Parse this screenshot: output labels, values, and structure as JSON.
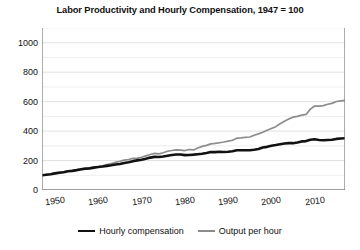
{
  "chart_data": {
    "type": "line",
    "title": "Labor Productivity and Hourly Compensation, 1947 = 100",
    "xlabel": "",
    "ylabel": "",
    "xlim": [
      1947,
      2017
    ],
    "ylim": [
      0,
      1100
    ],
    "grid": true,
    "grid_minor_step": 100,
    "legend_position": "bottom-center",
    "ytick_labels": [
      "0",
      "200",
      "400",
      "600",
      "800",
      "1000"
    ],
    "ytick_values": [
      0,
      200,
      400,
      600,
      800,
      1000
    ],
    "xtick_labels": [
      "1950",
      "1960",
      "1970",
      "1980",
      "1990",
      "2000",
      "2010"
    ],
    "xtick_values": [
      1950,
      1960,
      1970,
      1980,
      1990,
      2000,
      2010
    ],
    "x": [
      1947,
      1948,
      1949,
      1950,
      1951,
      1952,
      1953,
      1954,
      1955,
      1956,
      1957,
      1958,
      1959,
      1960,
      1961,
      1962,
      1963,
      1964,
      1965,
      1966,
      1967,
      1968,
      1969,
      1970,
      1971,
      1972,
      1973,
      1974,
      1975,
      1976,
      1977,
      1978,
      1979,
      1980,
      1981,
      1982,
      1983,
      1984,
      1985,
      1986,
      1987,
      1988,
      1989,
      1990,
      1991,
      1992,
      1993,
      1994,
      1995,
      1996,
      1997,
      1998,
      1999,
      2000,
      2001,
      2002,
      2003,
      2004,
      2005,
      2006,
      2007,
      2008,
      2009,
      2010,
      2011,
      2012,
      2013,
      2014,
      2015,
      2016,
      2017
    ],
    "series": [
      {
        "name": "Output per hour",
        "color": "#8c8c8c",
        "width": 1.7,
        "values": [
          100,
          104,
          108,
          117,
          120,
          123,
          128,
          131,
          137,
          138,
          143,
          148,
          155,
          157,
          164,
          172,
          180,
          188,
          195,
          203,
          207,
          215,
          217,
          222,
          232,
          241,
          249,
          245,
          253,
          263,
          268,
          272,
          271,
          268,
          275,
          272,
          285,
          296,
          303,
          313,
          316,
          321,
          326,
          332,
          338,
          352,
          354,
          358,
          360,
          372,
          381,
          392,
          406,
          418,
          430,
          450,
          467,
          482,
          495,
          500,
          508,
          513,
          549,
          570,
          570,
          573,
          582,
          588,
          601,
          605,
          608
        ]
      },
      {
        "name": "Hourly compensation",
        "color": "#111111",
        "width": 2.6,
        "values": [
          100,
          104,
          107,
          113,
          117,
          121,
          127,
          130,
          135,
          141,
          145,
          147,
          152,
          156,
          159,
          164,
          168,
          173,
          177,
          183,
          188,
          196,
          201,
          206,
          212,
          220,
          225,
          224,
          227,
          233,
          238,
          241,
          241,
          237,
          238,
          240,
          243,
          246,
          251,
          258,
          257,
          260,
          258,
          260,
          263,
          270,
          270,
          270,
          270,
          273,
          278,
          288,
          293,
          301,
          305,
          311,
          316,
          318,
          318,
          322,
          330,
          332,
          341,
          345,
          340,
          338,
          340,
          341,
          347,
          350,
          351
        ]
      }
    ]
  },
  "legend": {
    "entries": [
      {
        "label": "Hourly compensation",
        "swatch": "thick-black-line"
      },
      {
        "label": "Output per hour",
        "swatch": "thin-gray-line"
      }
    ]
  },
  "colors": {
    "hourly_compensation": "#111111",
    "output_per_hour": "#8c8c8c",
    "grid": "#d9d9d9",
    "axis": "#808080",
    "background": "#ffffff"
  }
}
